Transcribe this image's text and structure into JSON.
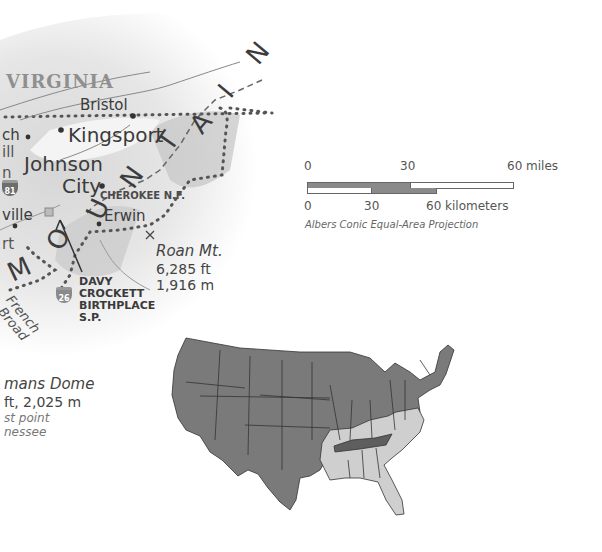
{
  "regional_map": {
    "state_label": "VIRGINIA",
    "cities": {
      "bristol": "Bristol",
      "kingsport": "Kingsport",
      "johnson": "Johnson",
      "city": "City",
      "erwin": "Erwin",
      "partial_ch": "ch",
      "partial_ill": "ill",
      "partial_n": "n",
      "partial_ville": "ville",
      "partial_rt": "rt"
    },
    "national_forest": "CHEROKEE N.F.",
    "park": [
      "DAVY",
      "CROCKETT",
      "BIRTHPLACE",
      "S.P."
    ],
    "interstate_shield": "81",
    "us_route_shield": "26",
    "mountain_letters": [
      "M",
      "O",
      "U",
      "N",
      "T",
      "A",
      "I",
      "N"
    ],
    "river": [
      "French",
      "Broad"
    ],
    "peaks": {
      "roan": {
        "name": "Roan Mt.",
        "ft": "6,285 ft",
        "m": "1,916 m"
      },
      "clingmans": {
        "name": "mans Dome",
        "elev": "ft, 2,025 m",
        "note1": "st point",
        "note2": "nessee"
      }
    }
  },
  "scale_bar": {
    "miles_ticks": [
      "0",
      "30",
      "60 miles"
    ],
    "km_ticks": [
      "0",
      "30",
      "60 kilometers"
    ],
    "projection": "Albers Conic Equal-Area Projection"
  },
  "locator_map": {
    "highlight_state": "Tennessee",
    "colors": {
      "other_states": "#7a7a7a",
      "region": "#cfcfcf",
      "highlight": "#5e5e5e",
      "borders": "#333333"
    }
  }
}
